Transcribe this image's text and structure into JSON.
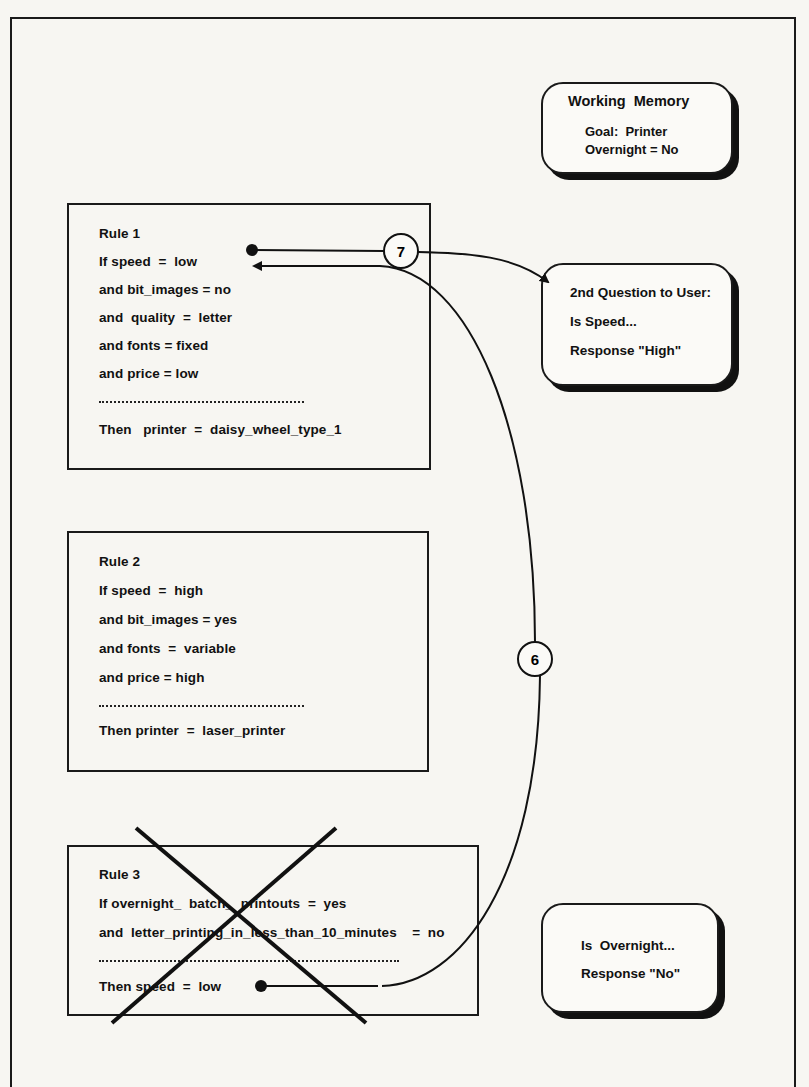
{
  "working_memory": {
    "title": "Working  Memory",
    "lines": [
      "Goal:  Printer",
      "Overnight = No"
    ]
  },
  "question_box": {
    "lines": [
      "2nd Question to User:",
      "Is Speed...",
      "Response \"High\""
    ]
  },
  "overnight_box": {
    "lines": [
      "Is  Overnight...",
      "Response \"No\""
    ]
  },
  "rules": [
    {
      "title": "Rule 1",
      "conditions": [
        "If speed  =  low",
        "and bit_images = no",
        "and  quality  =  letter",
        "and fonts = fixed",
        "and price = low"
      ],
      "conclusion": "Then   printer  =  daisy_wheel_type_1",
      "crossed_out": false
    },
    {
      "title": "Rule 2",
      "conditions": [
        "If speed  =  high",
        "and bit_images = yes",
        "and fonts  =  variable",
        "and price = high"
      ],
      "conclusion": "Then printer  =  laser_printer",
      "crossed_out": false
    },
    {
      "title": "Rule 3",
      "conditions": [
        "If overnight_  batch_  printouts  =  yes",
        "and  letter_printing_in_less_than_10_minutes    =  no"
      ],
      "conclusion": "Then speed  =  low",
      "crossed_out": true
    }
  ],
  "connectors": [
    {
      "step": "7",
      "from": "Rule 1 speed condition",
      "to": "2nd Question to User"
    },
    {
      "step": "6",
      "from": "Rule 3 conclusion",
      "to": "Rule 1 speed condition"
    }
  ]
}
